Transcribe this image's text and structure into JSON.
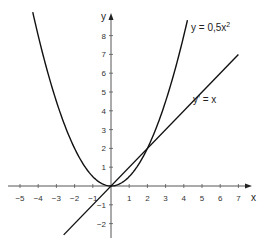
{
  "chart_data": {
    "type": "line",
    "title": "",
    "xlabel": "x",
    "ylabel": "y",
    "xlim": [
      -5.5,
      7.5
    ],
    "ylim": [
      -2.8,
      9.2
    ],
    "grid": false,
    "x_ticks": [
      -5,
      -4,
      -3,
      -2,
      -1,
      1,
      2,
      3,
      4,
      5,
      6,
      7
    ],
    "y_ticks": [
      -2,
      -1,
      1,
      2,
      3,
      4,
      5,
      6,
      7,
      8
    ],
    "series": [
      {
        "name": "y = 0,5x²",
        "expression": "0.5*x^2",
        "x_range": [
          -4.3,
          4.2
        ]
      },
      {
        "name": "y' = x",
        "expression": "x",
        "x_range": [
          -2.6,
          7
        ]
      }
    ],
    "annotations": [
      {
        "text": "y = 0,5x",
        "superscript": "2",
        "near": [
          4.4,
          8.3
        ]
      },
      {
        "text": "y' = x",
        "near": [
          4.6,
          4.9
        ]
      }
    ],
    "intersections": [
      [
        0,
        0
      ],
      [
        2,
        2
      ]
    ]
  },
  "axes": {
    "x_label": "x",
    "y_label": "y"
  },
  "labels": {
    "parabola_main": "y = 0,5x",
    "parabola_sup": "2",
    "line": "y' = x"
  }
}
